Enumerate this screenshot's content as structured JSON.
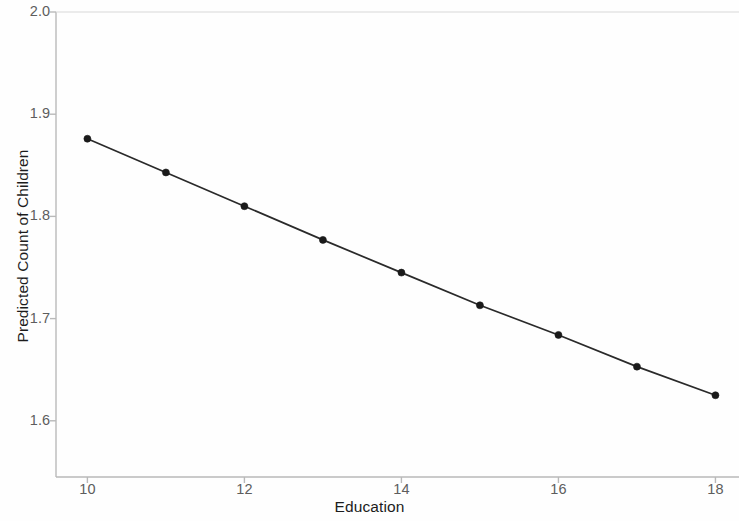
{
  "chart_data": {
    "type": "line",
    "title": "",
    "subtitle": "",
    "xlabel": "Education",
    "ylabel": "Predicted Count of Children",
    "x": [
      10,
      11,
      12,
      13,
      14,
      15,
      16,
      17,
      18
    ],
    "values": [
      1.876,
      1.843,
      1.81,
      1.777,
      1.745,
      1.713,
      1.684,
      1.653,
      1.625
    ],
    "series": [
      {
        "name": "Predicted Count of Children",
        "values": [
          1.876,
          1.843,
          1.81,
          1.777,
          1.745,
          1.713,
          1.684,
          1.653,
          1.625
        ]
      }
    ],
    "xlim": [
      9.6,
      18.3
    ],
    "ylim": [
      1.545,
      2.0
    ],
    "xticks": [
      10,
      12,
      14,
      16,
      18
    ],
    "xtick_labels": [
      "10",
      "12",
      "14",
      "16",
      "18"
    ],
    "yticks": [
      1.6,
      1.7,
      1.8,
      1.9,
      2.0
    ],
    "ytick_labels": [
      "1.6",
      "1.7",
      "1.8",
      "1.9",
      "2.0"
    ],
    "grid": false,
    "legend": null,
    "legend_position": "none",
    "marker": "filled-circle",
    "line_color": "#2a2a2a",
    "marker_color": "#1a1a1a",
    "axis_color": "#b9b9b9",
    "tick_label_color": "#5d5d5d",
    "axis_title_color": "#1c1c1c",
    "background_color": "#fefefe",
    "annotations": []
  }
}
